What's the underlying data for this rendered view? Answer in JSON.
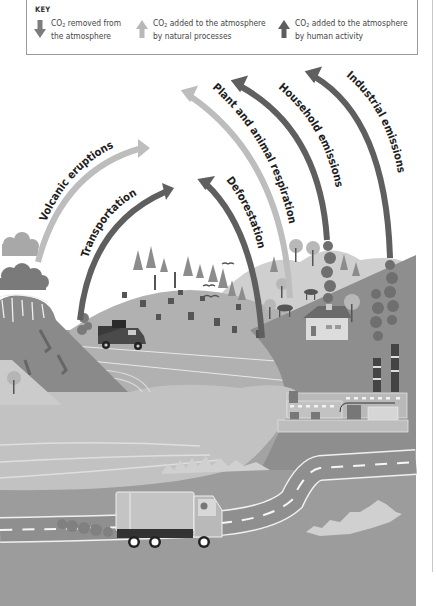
{
  "key": {
    "title": "KEY",
    "items": [
      {
        "icon": "arrow-down-icon",
        "line1_prefix": "CO",
        "line1_sub": "2",
        "line1_rest": " removed from",
        "line2": "the atmosphere",
        "color": "#7d7d7d"
      },
      {
        "icon": "arrow-up-light-icon",
        "line1_prefix": "CO",
        "line1_sub": "2",
        "line1_rest": " added to the atmosphere",
        "line2": "by natural processes",
        "color": "#b8b8b8"
      },
      {
        "icon": "arrow-up-dark-icon",
        "line1_prefix": "CO",
        "line1_sub": "2",
        "line1_rest": " added to the atmosphere",
        "line2": "by human activity",
        "color": "#5e5e5e"
      }
    ]
  },
  "arrows": [
    {
      "label": "Volcanic eruptions",
      "type": "natural"
    },
    {
      "label": "Transportation",
      "type": "human"
    },
    {
      "label": "Deforestation",
      "type": "human"
    },
    {
      "label": "Plant and animal respiration",
      "type": "natural"
    },
    {
      "label": "Household emissions",
      "type": "human"
    },
    {
      "label": "Industrial emissions",
      "type": "human"
    }
  ],
  "colors": {
    "natural_arrow": "#bdbdbd",
    "human_arrow": "#5f5f5f",
    "removed_arrow": "#7d7d7d",
    "ground": "#9c9c9c",
    "hill": "#b3b3b3",
    "water": "#bfbfbf",
    "volcano": "#8a8a8a"
  }
}
